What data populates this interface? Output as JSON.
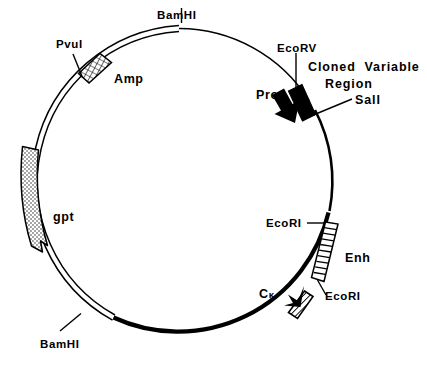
{
  "figure": {
    "type": "plasmid-map",
    "title": "",
    "background_color": "#ffffff",
    "line_color": "#000000",
    "circle": {
      "center_x": 179,
      "center_y": 183,
      "radius": 158
    }
  },
  "labels": {
    "bamhi_top": "BamHI",
    "pvul": "PvuI",
    "amp": "Amp",
    "gpt": "gpt",
    "bamhi_bottom": "BamHI",
    "ecorv": "EcoRV",
    "cloned_variable": "Cloned  Variable",
    "region": "Region",
    "sali": "SalI",
    "pro": "Pro",
    "ecori_upper": "EcoRI",
    "enh": "Enh",
    "ecori_lower": "EcoRI",
    "ck_c": "C",
    "ck_kappa": "κ"
  },
  "features": [
    {
      "name": "Amp",
      "label": "Amp",
      "fill": "cross-hatch",
      "start_angle_deg": 119,
      "end_angle_deg": 141,
      "description": "ampicillin resistance gene, cross-hatched box on upper-left arc"
    },
    {
      "name": "gpt",
      "label": "gpt",
      "fill": "stipple",
      "start_angle_deg": 172,
      "end_angle_deg": 212,
      "description": "gpt gene, stippled box with arrowhead pointing clockwise on left arc"
    },
    {
      "name": "Cloned Variable Region",
      "label": "Cloned  Variable Region",
      "fill": "solid-black",
      "start_angle_deg": 53,
      "end_angle_deg": 69,
      "description": "solid black box flanked by EcoRV and SalI sites on upper-right arc"
    },
    {
      "name": "Enh",
      "label": "Enh",
      "fill": "horizontal-stripes",
      "start_angle_deg": -22,
      "end_angle_deg": -44,
      "description": "enhancer, horizontally striped box between two EcoRI sites on right arc"
    },
    {
      "name": "Ck",
      "label": "Cκ",
      "fill": "diagonal-hatch",
      "start_angle_deg": -50,
      "end_angle_deg": -63,
      "description": "C-kappa constant region, diagonally hatched box with arrowhead on lower-right arc"
    }
  ],
  "restriction_sites": [
    {
      "name": "BamHI",
      "position": "top",
      "label": "BamHI"
    },
    {
      "name": "PvuI",
      "position": "upper-left",
      "label": "PvuI"
    },
    {
      "name": "BamHI",
      "position": "lower-left",
      "label": "BamHI"
    },
    {
      "name": "EcoRV",
      "position": "upper-right",
      "label": "EcoRV"
    },
    {
      "name": "SalI",
      "position": "upper-right",
      "label": "SalI"
    },
    {
      "name": "EcoRI",
      "position": "right",
      "label": "EcoRI"
    },
    {
      "name": "EcoRI",
      "position": "lower-right",
      "label": "EcoRI"
    }
  ],
  "arrows": [
    {
      "name": "Pro",
      "label": "Pro",
      "style": "thick-solid-black",
      "direction": "clockwise",
      "description": "promoter arrow pointing into cloned variable region"
    },
    {
      "name": "Ck-arrow",
      "label": "",
      "style": "thick-solid-black",
      "direction": "clockwise",
      "description": "small arrow at C-kappa segment"
    }
  ]
}
